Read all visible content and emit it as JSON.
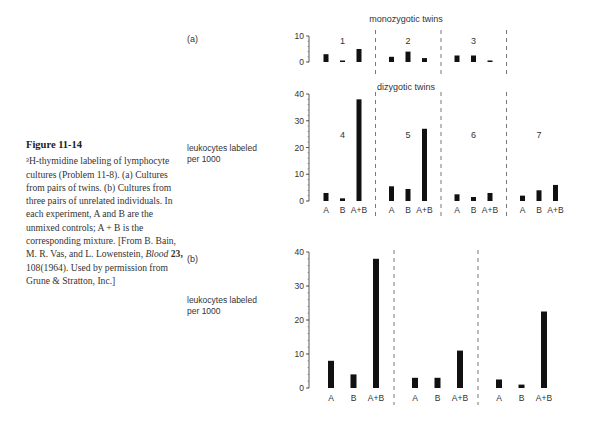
{
  "caption": {
    "title": "Figure 11-14",
    "text_parts": [
      "³H-thymidine labeling of lymphocyte cultures (Problem 11-8). (a) Cultures from pairs of twins. (b) Cultures from three pairs of unrelated individuals. In each experiment, A and B are the unmixed controls; A + B is the corresponding mixture. [From B. Bain, M. R. Vas, and L. Lowenstein, ",
      "Blood",
      " ",
      "23,",
      " 108(1964). Used by permission from Grune & Stratton, Inc.]"
    ]
  },
  "panel_labels": {
    "a": "(a)",
    "b": "(b)"
  },
  "ylabel_line1": "leukocytes labeled",
  "ylabel_line2": "per 1000",
  "chart_data": [
    {
      "type": "bar",
      "title": "monozygotic twins",
      "panel": "(a)",
      "ylabel": "leukocytes labeled per 1000",
      "ylim": [
        0,
        10
      ],
      "yticks": [
        0,
        10
      ],
      "grid": false,
      "categories": [
        "A",
        "B",
        "A+B"
      ],
      "groups": [
        {
          "name": "1",
          "values": [
            3,
            0.5,
            5
          ]
        },
        {
          "name": "2",
          "values": [
            2,
            4,
            1.5
          ]
        },
        {
          "name": "3",
          "values": [
            2.5,
            2.5,
            0.5
          ]
        }
      ]
    },
    {
      "type": "bar",
      "title": "dizygotic twins",
      "panel": "(a)",
      "ylabel": "leukocytes labeled per 1000",
      "ylim": [
        0,
        40
      ],
      "yticks": [
        0,
        10,
        20,
        30,
        40
      ],
      "grid": false,
      "categories": [
        "A",
        "B",
        "A+B"
      ],
      "groups": [
        {
          "name": "4",
          "values": [
            3,
            1,
            38
          ]
        },
        {
          "name": "5",
          "values": [
            5.5,
            4.5,
            27
          ]
        },
        {
          "name": "6",
          "values": [
            2.5,
            1.5,
            3
          ]
        },
        {
          "name": "7",
          "values": [
            2,
            4,
            6
          ]
        }
      ]
    },
    {
      "type": "bar",
      "title": "",
      "panel": "(b)",
      "ylabel": "leukocytes labeled per 1000",
      "ylim": [
        0,
        40
      ],
      "yticks": [
        0,
        10,
        20,
        30,
        40
      ],
      "grid": false,
      "categories": [
        "A",
        "B",
        "A+B"
      ],
      "groups": [
        {
          "name": "",
          "values": [
            8,
            4,
            38
          ]
        },
        {
          "name": "",
          "values": [
            3,
            3,
            11
          ]
        },
        {
          "name": "",
          "values": [
            2.5,
            1,
            22.5
          ]
        }
      ]
    }
  ]
}
